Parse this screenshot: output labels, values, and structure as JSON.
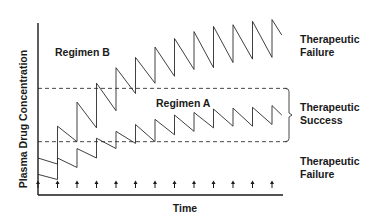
{
  "chart_data": {
    "type": "line",
    "title": "",
    "xlabel": "Time",
    "ylabel": "Plasma Drug Concentration",
    "xlim": [
      0,
      12.6
    ],
    "ylim": [
      0,
      100
    ],
    "grid": false,
    "dose_times": [
      0,
      1,
      2,
      3,
      4,
      5,
      6,
      7,
      8,
      9,
      10,
      11,
      12
    ],
    "dose_marker": "↑",
    "thresholds": [
      {
        "name": "Upper therapeutic limit",
        "value": 62,
        "style": "dashed"
      },
      {
        "name": "Lower therapeutic limit",
        "value": 31,
        "style": "dashed"
      }
    ],
    "series": [
      {
        "name": "Regimen B",
        "label": "Regimen B",
        "peaks": [
          21.5,
          40,
          54,
          65,
          74,
          80,
          86,
          91,
          95,
          98,
          99,
          101,
          102
        ],
        "troughs": [
          18,
          31,
          39,
          49,
          59,
          65,
          69,
          73,
          74,
          77,
          79,
          80
        ],
        "end_value": 93
      },
      {
        "name": "Regimen A",
        "label": "Regimen A",
        "peaks": [
          12,
          21.5,
          27,
          33,
          37,
          41,
          44,
          46.5,
          48,
          50,
          50.5,
          51,
          52
        ],
        "troughs": [
          9,
          16,
          21.5,
          27,
          30,
          31,
          35,
          37,
          39,
          40,
          40,
          41
        ],
        "end_value": 46.5
      }
    ],
    "annotations": [
      {
        "text": [
          "Therapeutic",
          "Failure"
        ],
        "region": "above upper limit"
      },
      {
        "text": [
          "Therapeutic",
          "Success"
        ],
        "region": "between limits"
      },
      {
        "text": [
          "Therapeutic",
          "Failure"
        ],
        "region": "below lower limit"
      }
    ]
  }
}
